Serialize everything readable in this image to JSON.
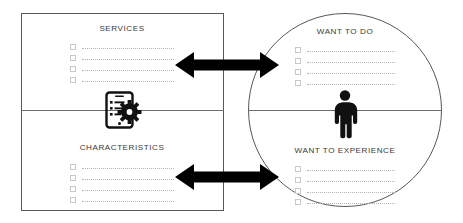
{
  "diagram": {
    "colors": {
      "outline": "#58585a",
      "divider": "#6e6e70",
      "arrow": "#000000",
      "icon": "#111111",
      "heading_text": "#3a3a3a",
      "checkbox_border": "#c9c9c9",
      "dotted_line": "#b4b4b4",
      "background": "#ffffff"
    },
    "left_panel": {
      "shape": "rectangle",
      "sections": [
        {
          "id": "services",
          "heading": "SERVICES",
          "item_count": 4,
          "items": [
            "",
            "",
            "",
            ""
          ]
        },
        {
          "id": "characteristics",
          "heading": "CHARACTERISTICS",
          "item_count": 4,
          "items": [
            "",
            "",
            "",
            ""
          ]
        }
      ],
      "center_icon": "mobile-app-settings-icon"
    },
    "right_panel": {
      "shape": "circle",
      "sections": [
        {
          "id": "want-to-do",
          "heading": "WANT TO DO",
          "item_count": 4,
          "items": [
            "",
            "",
            "",
            ""
          ]
        },
        {
          "id": "want-to-experience",
          "heading": "WANT TO EXPERIENCE",
          "item_count": 4,
          "items": [
            "",
            "",
            "",
            ""
          ]
        }
      ],
      "center_icon": "person-icon"
    },
    "connectors": [
      {
        "id": "top-connector",
        "type": "double-headed-arrow",
        "direction": "bidirectional"
      },
      {
        "id": "bottom-connector",
        "type": "double-headed-arrow",
        "direction": "bidirectional"
      }
    ]
  }
}
